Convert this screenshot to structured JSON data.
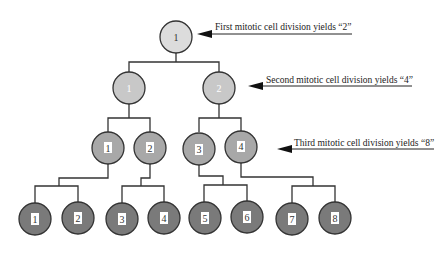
{
  "diagram": {
    "annotations": [
      {
        "id": "first",
        "text": "First mitotic cell division yields “2”"
      },
      {
        "id": "second",
        "text": "Second mitotic cell division yields “4”"
      },
      {
        "id": "third",
        "text": "Third mitotic cell division yields “8”"
      }
    ],
    "levels": [
      {
        "cells": [
          "1"
        ],
        "fill": "#dcdcdc"
      },
      {
        "cells": [
          "1",
          "2"
        ],
        "fill": "#c8c8c8"
      },
      {
        "cells": [
          "1",
          "2",
          "3",
          "4"
        ],
        "fill": "#a8a8a8"
      },
      {
        "cells": [
          "1",
          "2",
          "3",
          "4",
          "5",
          "6",
          "7",
          "8"
        ],
        "fill": "#7a7a7a"
      }
    ]
  }
}
